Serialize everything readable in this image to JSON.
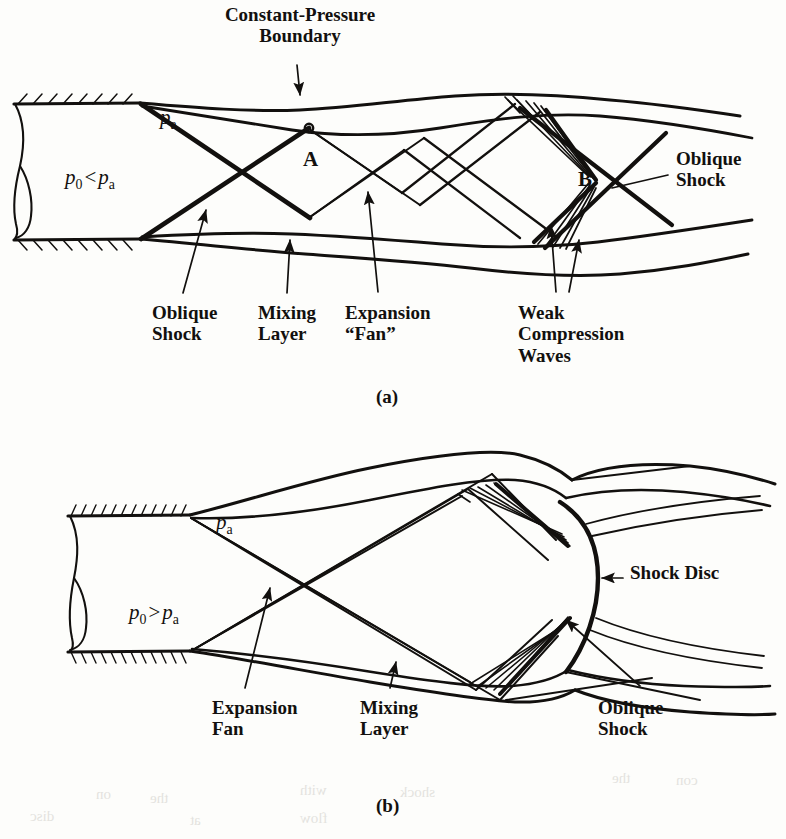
{
  "figure": {
    "kind": "technical-diagram",
    "background_color": "#fdfdfb",
    "ink_color": "#12100e"
  },
  "panel_a": {
    "caption": "(a)",
    "title": "Constant-Pressure\nBoundary",
    "pressure_condition": {
      "p_symbol": "p",
      "sub0": "0",
      "relation": "<",
      "suba": "a"
    },
    "exit_pressure_label": {
      "p_symbol": "p",
      "sub": "a"
    },
    "points": [
      {
        "label": "A",
        "x": 309,
        "y": 160
      },
      {
        "label": "B",
        "x": 583,
        "y": 180
      }
    ],
    "annotations": [
      {
        "name": "oblique-shock-left",
        "text": "Oblique\nShock",
        "x": 152,
        "y": 302
      },
      {
        "name": "mixing-layer",
        "text": "Mixing\nLayer",
        "x": 258,
        "y": 302
      },
      {
        "name": "expansion-fan",
        "text": "Expansion\n“Fan”",
        "x": 345,
        "y": 302
      },
      {
        "name": "weak-compression-waves",
        "text": "Weak\nCompression\nWaves",
        "x": 518,
        "y": 302
      },
      {
        "name": "oblique-shock-right",
        "text": "Oblique\nShock",
        "x": 676,
        "y": 148
      }
    ]
  },
  "panel_b": {
    "caption": "(b)",
    "pressure_condition": {
      "p_symbol": "p",
      "sub0": "0",
      "relation": ">",
      "suba": "a"
    },
    "exit_pressure_label": {
      "p_symbol": "p",
      "sub": "a"
    },
    "annotations": [
      {
        "name": "shock-disc",
        "text": "Shock Disc",
        "x": 630,
        "y": 573
      },
      {
        "name": "expansion-fan",
        "text": "Expansion\nFan",
        "x": 212,
        "y": 697
      },
      {
        "name": "mixing-layer",
        "text": "Mixing\nLayer",
        "x": 360,
        "y": 697
      },
      {
        "name": "oblique-shock",
        "text": "Oblique\nShock",
        "x": 598,
        "y": 697
      }
    ]
  },
  "bleed_through": [
    {
      "text": "the",
      "x": 612,
      "y": 770
    },
    {
      "text": "con",
      "x": 676,
      "y": 772
    },
    {
      "text": "on",
      "x": 96,
      "y": 786
    },
    {
      "text": "the",
      "x": 150,
      "y": 790
    },
    {
      "text": "with",
      "x": 300,
      "y": 782
    },
    {
      "text": "shock",
      "x": 400,
      "y": 784
    },
    {
      "text": "disc",
      "x": 30,
      "y": 808
    },
    {
      "text": "at",
      "x": 190,
      "y": 812
    },
    {
      "text": "flow",
      "x": 300,
      "y": 810
    }
  ]
}
